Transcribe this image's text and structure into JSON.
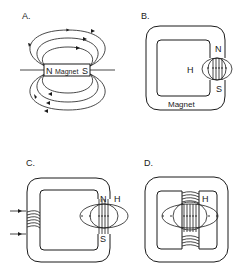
{
  "panels": [
    {
      "id": "A",
      "label": "A.",
      "description": "Bar magnet with external field lines",
      "magnet_text": "Magnet",
      "north": "N",
      "south": "S"
    },
    {
      "id": "B",
      "label": "B.",
      "description": "Ring magnet with air gap and fringing field H",
      "north": "N",
      "south": "S",
      "field": "H",
      "magnet_text": "Magnet"
    },
    {
      "id": "C",
      "label": "C.",
      "description": "Electromagnet: coil on yoke with air gap",
      "north": "N",
      "south": "S",
      "field": "H"
    },
    {
      "id": "D",
      "label": "D.",
      "description": "Yoke with central pole pieces, coils, and field H in gap",
      "field": "H"
    }
  ],
  "colors": {
    "ink": "#1a1a1a",
    "background": "#ffffff"
  }
}
